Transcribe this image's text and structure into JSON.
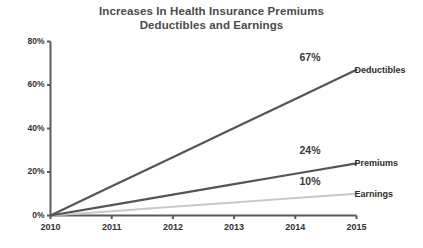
{
  "chart_data": {
    "type": "line",
    "title": "Increases In Health Insurance Premiums Deductibles and Earnings",
    "title_lines": [
      "Increases In Health Insurance Premiums",
      "Deductibles and Earnings"
    ],
    "xlabel": "",
    "ylabel": "",
    "x": [
      2010,
      2011,
      2012,
      2013,
      2014,
      2015
    ],
    "xtick_labels": [
      "2010",
      "2011",
      "2012",
      "2013",
      "2014",
      "2015"
    ],
    "ytick_labels": [
      "0%",
      "20%",
      "40%",
      "60%",
      "80%"
    ],
    "ytick_values": [
      0,
      20,
      40,
      60,
      80
    ],
    "ylim": [
      0,
      80
    ],
    "xlim": [
      2010,
      2015
    ],
    "grid": false,
    "legend": "inline-end-labels",
    "series": [
      {
        "name": "Deductibles",
        "end_label": "67%",
        "end_value": 67,
        "color": "#555555",
        "values": [
          0,
          13.4,
          26.8,
          40.2,
          53.6,
          67
        ]
      },
      {
        "name": "Premiums",
        "end_label": "24%",
        "end_value": 24,
        "color": "#555555",
        "values": [
          0,
          4.8,
          9.6,
          14.4,
          19.2,
          24
        ]
      },
      {
        "name": "Earnings",
        "end_label": "10%",
        "end_value": 10,
        "color": "#c9c9c9",
        "values": [
          0,
          2,
          4,
          6,
          8,
          10
        ]
      }
    ],
    "axis_color": "#5a5a5a"
  }
}
